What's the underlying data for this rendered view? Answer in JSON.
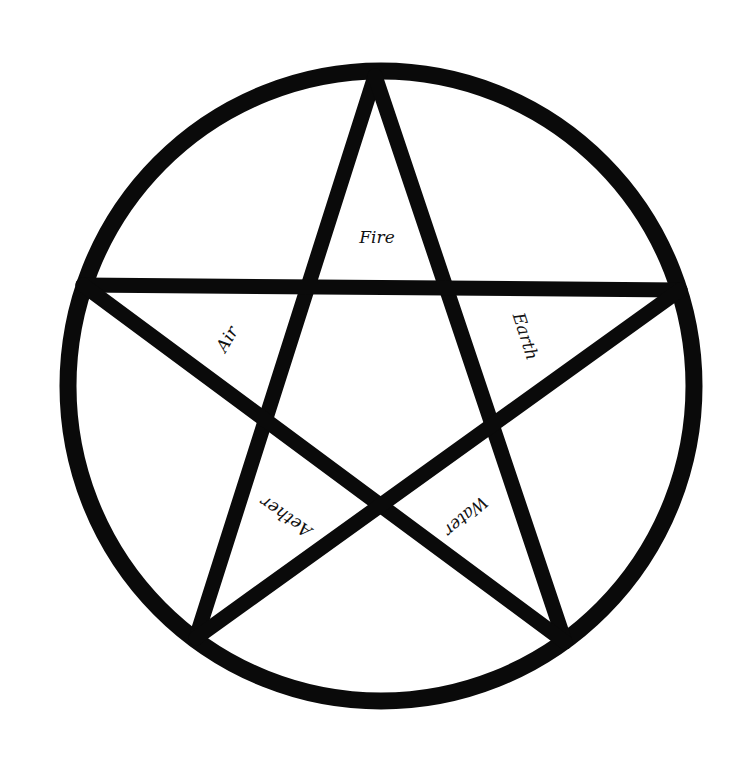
{
  "figure": {
    "type": "pentagram",
    "background": "#ffffff",
    "ink_color": "#0a0a0a",
    "circle": {
      "cx": 381,
      "cy": 386,
      "r": 314,
      "stroke_width": 17
    },
    "star": {
      "stroke_width": 15,
      "points": {
        "top": [
          375,
          76
        ],
        "left": [
          83,
          285
        ],
        "right": [
          680,
          290
        ],
        "bottom_left": [
          196,
          638
        ],
        "bottom_right": [
          565,
          642
        ]
      }
    },
    "labels": {
      "fire": "Fire",
      "air": "Air",
      "earth": "Earth",
      "aether": "Aether",
      "water": "Water"
    }
  }
}
